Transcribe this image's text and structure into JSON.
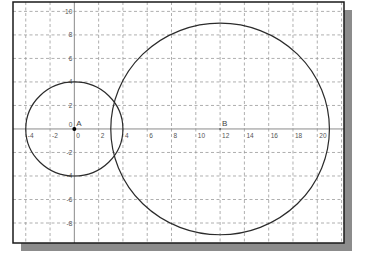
{
  "chart_data": {
    "type": "geometry",
    "title": "",
    "xlabel": "",
    "ylabel": "",
    "xlim": [
      -5.05,
      22.2
    ],
    "ylim": [
      -9.7,
      10.8
    ],
    "grid": true,
    "grid_step": 2,
    "x_ticks": [
      -4,
      -2,
      0,
      2,
      4,
      6,
      8,
      10,
      12,
      14,
      16,
      18,
      20
    ],
    "y_ticks": [
      10,
      8,
      6,
      4,
      2,
      0,
      -2,
      -4,
      -6,
      -8
    ],
    "points": [
      {
        "name": "A",
        "x": 0,
        "y": 0
      },
      {
        "name": "B",
        "x": 12,
        "y": 0
      }
    ],
    "circles": [
      {
        "name": "circle-A",
        "center": "A",
        "cx": 0,
        "cy": 0,
        "r": 4
      },
      {
        "name": "circle-B",
        "center": "B",
        "cx": 12,
        "cy": 0,
        "r": 9
      }
    ]
  },
  "layout": {
    "frame": {
      "left": 13,
      "top": 2,
      "right": 344,
      "bottom": 243
    },
    "shadow_offset": 8,
    "colors": {
      "frame": "#1a1a1a",
      "shadow": "#8c8c8c",
      "grid": "#9a9a9a",
      "axis": "#8a8a8a",
      "curve": "#2b2b2b",
      "point": "#000000"
    }
  }
}
